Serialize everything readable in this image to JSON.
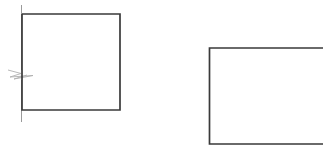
{
  "canvas": {
    "width": 323,
    "height": 151,
    "background_color": "#ffffff",
    "title": "Two-rectangle line drawing with break symbol"
  },
  "style": {
    "stroke_color": "#3a3a3a",
    "stroke_color_light": "#9a9a9a",
    "stroke_width_main": 1.6,
    "stroke_width_thin": 1.1,
    "stroke_width_hairline": 0.9
  },
  "shapes": [
    {
      "id": "left-rectangle",
      "name": "closed-rectangle-with-break",
      "description": "Closed rectangle outline with a broken-off left vertical extension line",
      "bounds": {
        "x": 22,
        "y": 14,
        "width": 98,
        "height": 96
      },
      "path": "M 22 14 L 120 14 L 120 110 L 22 110 L 22 14"
    },
    {
      "id": "left-extension-line-upper",
      "name": "extension-line-upper",
      "description": "Vertical extension line above break symbol",
      "path": "M 21.5 5 L 21.5 70"
    },
    {
      "id": "left-extension-line-lower",
      "name": "extension-line-lower",
      "description": "Vertical extension line below break symbol",
      "path": "M 21.5 80 L 21.5 122"
    },
    {
      "id": "break-symbol",
      "name": "break-symbol-zigzag",
      "description": "Zigzag break symbol crossing the left vertical line",
      "center": {
        "x": 21,
        "y": 75
      },
      "path": "M 8 70 L 21 73.5 L 10 77 L 33 75.5 L 14 79 L 27 75"
    },
    {
      "id": "right-rectangle",
      "name": "open-rectangle-right",
      "description": "Open rectangle (top, left, bottom edges only) running off the right edge of the canvas",
      "bounds": {
        "x": 209,
        "y": 48,
        "width": 114,
        "height": 96
      },
      "path": "M 323 48 L 209.5 48 L 209.5 144 L 323 144"
    }
  ],
  "annotations": {
    "shape_count": 2,
    "left_shape_label": "Closed rectangle",
    "right_shape_label": "Open rectangle",
    "break_symbol_label": "Break symbol"
  }
}
